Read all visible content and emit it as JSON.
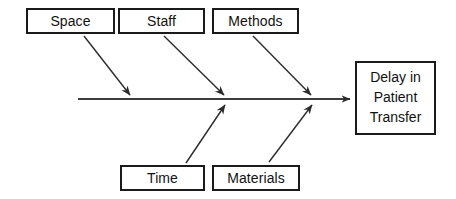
{
  "diagram": {
    "type": "fishbone-ishikawa",
    "title": "",
    "effect": {
      "name": "effect-node",
      "lines": [
        "Delay in",
        "Patient",
        "Transfer"
      ],
      "full_text": "Delay in Patient Transfer"
    },
    "causes_top": [
      {
        "name": "space",
        "label": "Space"
      },
      {
        "name": "staff",
        "label": "Staff"
      },
      {
        "name": "methods",
        "label": "Methods"
      }
    ],
    "causes_bottom": [
      {
        "name": "time",
        "label": "Time"
      },
      {
        "name": "materials",
        "label": "Materials"
      }
    ],
    "colors": {
      "background": "#ffffff",
      "box_border": "#1a1a1a",
      "box_fill": "#ffffff",
      "text": "#111111",
      "spine": "#3d3d3d",
      "bone": "#2b2b2b"
    }
  }
}
